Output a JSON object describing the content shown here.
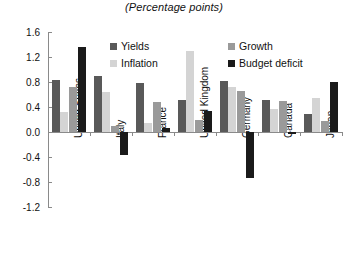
{
  "chart_data": {
    "type": "bar",
    "title": "(Percentage points)",
    "xlabel": "",
    "ylabel": "",
    "ylim": [
      -1.2,
      1.6
    ],
    "ytick_step": 0.4,
    "yticks": [
      "1.6",
      "1.2",
      "0.8",
      "0.4",
      "0.0",
      "-0.4",
      "-0.8",
      "-1.2"
    ],
    "grid": false,
    "legend_position": "top-center",
    "categories": [
      "United States",
      "Italy",
      "France",
      "United Kingdom",
      "Germany",
      "Canada",
      "Japan"
    ],
    "series": [
      {
        "name": "Yields",
        "color": "#595959",
        "values": [
          0.84,
          0.89,
          0.78,
          0.51,
          0.82,
          0.52,
          0.29
        ]
      },
      {
        "name": "Inflation",
        "color": "#d4d4d4",
        "values": [
          0.32,
          0.64,
          0.15,
          1.29,
          0.72,
          0.37,
          0.55
        ]
      },
      {
        "name": "Growth",
        "color": "#9a9a9a",
        "values": [
          0.72,
          0.1,
          0.48,
          0.2,
          0.66,
          0.5,
          0.17
        ]
      },
      {
        "name": "Budget deficit",
        "color": "#1a1a1a",
        "values": [
          1.36,
          -0.36,
          0.06,
          0.33,
          -0.73,
          -0.03,
          0.8
        ]
      }
    ]
  },
  "legend": {
    "items": [
      {
        "label": "Yields",
        "swatch": "#595959"
      },
      {
        "label": "Growth",
        "swatch": "#9a9a9a"
      },
      {
        "label": "Inflation",
        "swatch": "#d4d4d4"
      },
      {
        "label": "Budget deficit",
        "swatch": "#1a1a1a"
      }
    ]
  }
}
